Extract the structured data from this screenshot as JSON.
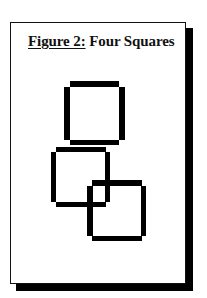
{
  "figure": {
    "label": "Figure 2:",
    "title": "Four Squares",
    "colors": {
      "stroke": "#000000",
      "background": "#ffffff",
      "shadow": "#000000"
    }
  },
  "squares": [
    {
      "name": "top-square",
      "x": 64,
      "y": 81,
      "width": 60,
      "height": 64
    },
    {
      "name": "middle-square",
      "x": 51,
      "y": 147,
      "width": 59,
      "height": 60
    },
    {
      "name": "bottom-square",
      "x": 87,
      "y": 180,
      "width": 59,
      "height": 61
    }
  ]
}
